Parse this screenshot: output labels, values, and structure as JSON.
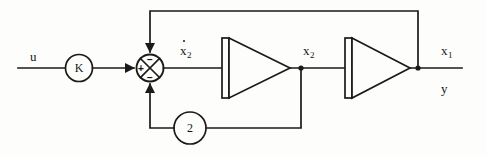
{
  "diagram": {
    "type": "control-block-diagram",
    "stroke_color": "#1a1a1a",
    "background_color": "#fdfdfc",
    "input": {
      "label": "u",
      "x": 30,
      "y": 56
    },
    "gain_k": {
      "label": "K",
      "cx": 79,
      "cy": 68,
      "r": 13.5
    },
    "summing_junction": {
      "cx": 150,
      "cy": 68,
      "r": 13.5,
      "signs": {
        "top": "−",
        "left": "+",
        "bottom": "−"
      }
    },
    "integrator_1": {
      "name": "integrator-1",
      "bar_x": 222,
      "bar_y": 38,
      "bar_w": 7,
      "bar_h": 60,
      "apex_x": 290,
      "apex_y": 68
    },
    "integrator_2": {
      "name": "integrator-2",
      "bar_x": 345,
      "bar_y": 38,
      "bar_w": 7,
      "bar_h": 60,
      "apex_x": 410,
      "apex_y": 68
    },
    "feedback_gain": {
      "label": "2",
      "cx": 190,
      "cy": 128,
      "r": 16
    },
    "signal_labels": [
      {
        "name": "x2-dot",
        "base": "x",
        "sub": "2",
        "dot": true,
        "x": 180,
        "y": 44
      },
      {
        "name": "x2",
        "base": "x",
        "sub": "2",
        "dot": false,
        "x": 303,
        "y": 44
      },
      {
        "name": "x1",
        "base": "x",
        "sub": "1",
        "dot": false,
        "x": 441,
        "y": 44
      },
      {
        "name": "y",
        "base": "y",
        "sub": "",
        "dot": false,
        "x": 441,
        "y": 82
      }
    ],
    "nodes": [
      {
        "name": "node-x2",
        "x": 301,
        "y": 68
      },
      {
        "name": "node-x1",
        "x": 418,
        "y": 68
      }
    ],
    "paths": {
      "input_line": "M 18 68 L 65.5 68",
      "k_to_sum": "M 92.5 68 L 132 68",
      "sum_to_int1": "M 163.5 68 L 222 68",
      "int1_to_int2": "M 290 68 L 345 68",
      "int2_to_out": "M 410 68 L 462 68",
      "top_feedback": "M 418 68 L 418 11 L 150 11 L 150 50",
      "bottom_feedback_right": "M 301 68 L 301 128 L 206 128",
      "bottom_feedback_left": "M 174 128 L 150 128 L 150 86"
    }
  }
}
